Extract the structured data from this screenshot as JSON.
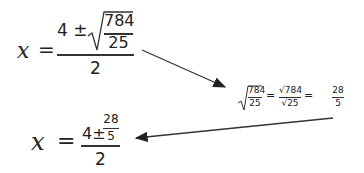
{
  "equation1": {
    "lhs": "x",
    "equals": "=",
    "numerator_prefix": "4 ±",
    "sqrt_num": "784",
    "sqrt_den": "25",
    "denominator": "2"
  },
  "equation2": {
    "sqrt_num": "784",
    "sqrt_den": "25",
    "eq1": "=",
    "root_num": "√784",
    "root_den": "√25",
    "eq2": "=",
    "result_num": "28",
    "result_den": "5"
  },
  "equation3": {
    "lhs": "x",
    "equals": "=",
    "numerator_prefix": "4±",
    "frac_num": "28",
    "frac_den": "5",
    "denominator": "2"
  },
  "colors": {
    "ink": "#222222",
    "arrow": "#333333"
  }
}
